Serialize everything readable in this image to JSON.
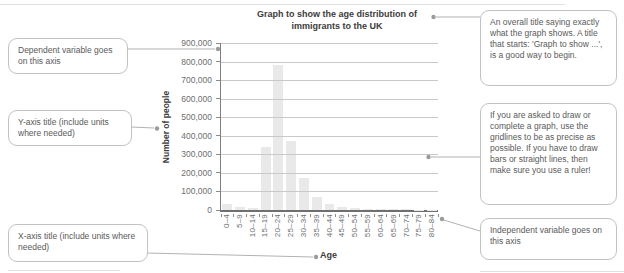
{
  "page": {
    "background": "#ffffff"
  },
  "chart_data": {
    "type": "bar",
    "title_lines": [
      "Graph to show the age distribution of",
      "immigrants to the UK"
    ],
    "xlabel": "Age",
    "ylabel": "Number of people",
    "categories": [
      "0–4",
      "5–9",
      "10–14",
      "15–19",
      "20–24",
      "25–29",
      "30–34",
      "35–39",
      "40–44",
      "45–49",
      "50–54",
      "55–59",
      "60–64",
      "65–69",
      "70–74",
      "75–79",
      "80–84"
    ],
    "values": [
      30000,
      15000,
      10000,
      340000,
      780000,
      370000,
      170000,
      70000,
      35000,
      15000,
      10000,
      8000,
      5000,
      4000,
      3000,
      2000,
      2000
    ],
    "ylim": [
      0,
      900000
    ],
    "ytick_step": 100000,
    "ytick_labels": [
      "900,000",
      "800,000",
      "700,000",
      "600,000",
      "500,000",
      "400,000",
      "300,000",
      "200,000",
      "100,000",
      "0"
    ],
    "grid": true,
    "legend": "none",
    "bar_color": "#e9e9e9"
  },
  "callouts": {
    "dependent_variable": "Dependent variable goes on this axis",
    "y_axis_title": "Y-axis title (include units where needed)",
    "x_axis_title": "X-axis title (include units where needed)",
    "overall_title": "An overall title saying exactly what the graph shows. A title that starts: 'Graph to show ...', is a good way to begin.",
    "gridlines_tip": "If you are asked to draw or complete a graph, use the gridlines to be as precise as possible. If you have to draw bars or straight lines, then make sure you use a ruler!",
    "independent_variable": "Independent variable goes on this axis"
  },
  "colors": {
    "bar": "#e9e9e9",
    "gridline": "#c9c9c9",
    "axis": "#7f7f7f",
    "tick_text": "#6e6e6e",
    "title_text": "#3c3c3c",
    "box_border": "#c2c2c2",
    "box_text": "#5a5a5a",
    "connector": "#b2b2b2",
    "dot": "#9b9b9b"
  }
}
